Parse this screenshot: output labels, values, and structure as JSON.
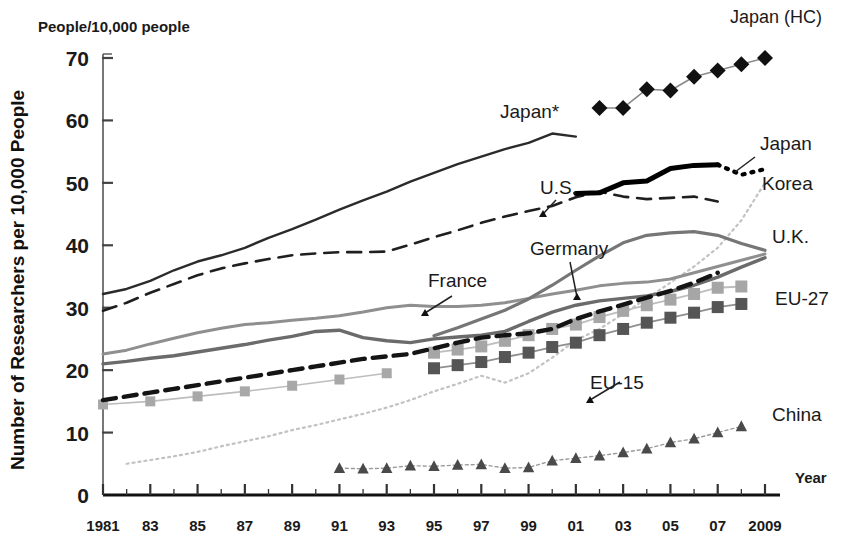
{
  "chart_data": {
    "type": "line",
    "title": "",
    "unit_note": "People/10,000 people",
    "ylabel": "Number of Researchers per 10,000 People",
    "xlabel": "Year",
    "ylim": [
      0,
      70
    ],
    "yticks": [
      "0",
      "10",
      "20",
      "30",
      "40",
      "50",
      "60",
      "70"
    ],
    "xlim": [
      1981,
      2009
    ],
    "xticks": [
      "1981",
      "83",
      "85",
      "87",
      "89",
      "91",
      "93",
      "95",
      "97",
      "99",
      "01",
      "03",
      "05",
      "07",
      "2009"
    ],
    "grid": false,
    "legend_position": "inline-annotations",
    "series": [
      {
        "name": "Japan*",
        "label": "Japan*",
        "style": "solid-thin-dark",
        "color": "#2b2b2b",
        "x": [
          1981,
          1982,
          1983,
          1984,
          1985,
          1986,
          1987,
          1988,
          1989,
          1990,
          1991,
          1992,
          1993,
          1994,
          1995,
          1996,
          1997,
          1998,
          1999,
          2000,
          2001
        ],
        "values": [
          32.2,
          33.0,
          34.3,
          36.0,
          37.4,
          38.4,
          39.6,
          41.2,
          42.6,
          44.1,
          45.7,
          47.2,
          48.6,
          50.2,
          51.6,
          53.0,
          54.2,
          55.4,
          56.4,
          57.9,
          57.4
        ]
      },
      {
        "name": "U.S.",
        "label": "U.S.",
        "style": "dashed-dark",
        "color": "#1f1f1f",
        "x": [
          1981,
          1982,
          1983,
          1984,
          1985,
          1986,
          1987,
          1988,
          1989,
          1990,
          1991,
          1992,
          1993,
          1994,
          1995,
          1996,
          1997,
          1998,
          1999,
          2000,
          2001,
          2002,
          2003,
          2004,
          2005,
          2006,
          2007
        ],
        "values": [
          29.5,
          30.8,
          32.4,
          33.8,
          35.2,
          36.3,
          37.1,
          37.8,
          38.4,
          38.7,
          38.9,
          38.9,
          39.0,
          40.1,
          41.3,
          42.4,
          43.6,
          44.6,
          45.5,
          46.3,
          47.7,
          48.6,
          47.8,
          47.4,
          47.6,
          47.8,
          47.0
        ]
      },
      {
        "name": "Japan",
        "label": "Japan",
        "style": "solid-thick-black",
        "color": "#000000",
        "x": [
          2001,
          2002,
          2003,
          2004,
          2005,
          2006,
          2007
        ],
        "values": [
          48.3,
          48.4,
          50.0,
          50.3,
          52.3,
          52.8,
          52.9
        ]
      },
      {
        "name": "Japan (tail)",
        "label": "",
        "style": "dotted-black",
        "color": "#000000",
        "x": [
          2007,
          2008,
          2009
        ],
        "values": [
          52.9,
          51.3,
          52.2
        ]
      },
      {
        "name": "Japan (HC)",
        "label": "Japan (HC)",
        "style": "marker-diamond",
        "color": "#111111",
        "x": [
          2002,
          2003,
          2004,
          2005,
          2006,
          2007,
          2008,
          2009
        ],
        "values": [
          62.0,
          62.0,
          65.0,
          64.8,
          67.0,
          68.0,
          69.0,
          70.0
        ]
      },
      {
        "name": "Korea",
        "label": "Korea",
        "style": "dotted-lightgray",
        "color": "#b9b9b9",
        "x": [
          1982,
          1983,
          1984,
          1985,
          1986,
          1987,
          1988,
          1989,
          1990,
          1991,
          1992,
          1993,
          1994,
          1995,
          1996,
          1997,
          1998,
          1999,
          2000,
          2001,
          2002,
          2003,
          2004,
          2005,
          2006,
          2007,
          2008,
          2009
        ],
        "values": [
          5.0,
          5.6,
          6.2,
          6.9,
          7.8,
          8.6,
          9.4,
          10.4,
          11.2,
          12.1,
          13.0,
          14.0,
          15.2,
          16.6,
          17.8,
          19.1,
          18.0,
          19.5,
          22.0,
          24.8,
          26.6,
          29.0,
          31.5,
          34.0,
          36.6,
          39.6,
          44.0,
          50.0
        ]
      },
      {
        "name": "Germany",
        "label": "Germany",
        "style": "solid-gray",
        "color": "#6d6d6d",
        "x": [
          1981,
          1982,
          1983,
          1984,
          1985,
          1986,
          1987,
          1988,
          1989,
          1990,
          1991,
          1992,
          1993,
          1994,
          1995,
          1996,
          1997,
          1998,
          1999,
          2000,
          2001,
          2002,
          2003,
          2004,
          2005,
          2006,
          2007,
          2008,
          2009
        ],
        "values": [
          21.0,
          21.4,
          21.9,
          22.3,
          22.9,
          23.5,
          24.1,
          24.8,
          25.4,
          26.2,
          26.4,
          25.2,
          24.7,
          24.4,
          25.0,
          25.3,
          25.6,
          26.2,
          27.8,
          29.3,
          30.4,
          31.1,
          31.5,
          31.9,
          32.6,
          33.6,
          34.9,
          36.5,
          38.0
        ]
      },
      {
        "name": "France",
        "label": "France",
        "style": "solid-gray-light",
        "color": "#8a8a8a",
        "x": [
          1981,
          1982,
          1983,
          1984,
          1985,
          1986,
          1987,
          1988,
          1989,
          1990,
          1991,
          1992,
          1993,
          1994,
          1995,
          1996,
          1997,
          1998,
          1999,
          2000,
          2001,
          2002,
          2003,
          2004,
          2005,
          2006,
          2007,
          2008,
          2009
        ],
        "values": [
          22.6,
          23.2,
          24.2,
          25.1,
          26.0,
          26.7,
          27.3,
          27.6,
          28.0,
          28.3,
          28.7,
          29.3,
          30.0,
          30.4,
          30.2,
          30.2,
          30.4,
          30.8,
          31.5,
          32.2,
          32.8,
          33.5,
          33.9,
          34.1,
          34.6,
          35.6,
          36.6,
          37.6,
          38.6
        ]
      },
      {
        "name": "U.K.",
        "label": "U.K.",
        "style": "solid-gray-mid",
        "color": "#707070",
        "x": [
          1995,
          1996,
          1997,
          1998,
          1999,
          2000,
          2001,
          2002,
          2003,
          2004,
          2005,
          2006,
          2007,
          2008,
          2009
        ],
        "values": [
          25.5,
          26.8,
          28.2,
          29.6,
          31.4,
          33.6,
          36.0,
          38.3,
          40.4,
          41.6,
          42.0,
          42.2,
          41.6,
          40.3,
          39.2
        ]
      },
      {
        "name": "EU-15",
        "label": "EU-15",
        "style": "marker-square-light",
        "color": "#a0a0a0",
        "x": [
          1995,
          1996,
          1997,
          1998,
          1999,
          2000,
          2001,
          2002,
          2003,
          2004,
          2005,
          2006,
          2007,
          2008
        ],
        "values": [
          22.8,
          23.3,
          23.8,
          24.7,
          25.6,
          26.6,
          27.3,
          28.5,
          29.5,
          30.4,
          31.3,
          32.2,
          33.2,
          33.4
        ]
      },
      {
        "name": "EU-27",
        "label": "EU-27",
        "style": "marker-square-dark",
        "color": "#5a5a5a",
        "x": [
          1995,
          1996,
          1997,
          1998,
          1999,
          2000,
          2001,
          2002,
          2003,
          2004,
          2005,
          2006,
          2007,
          2008
        ],
        "values": [
          20.3,
          20.8,
          21.3,
          22.1,
          22.8,
          23.7,
          24.4,
          25.6,
          26.6,
          27.6,
          28.4,
          29.2,
          30.1,
          30.6
        ]
      },
      {
        "name": "EU-15 dashed",
        "label": "",
        "style": "dashed-thick-black",
        "color": "#101010",
        "x": [
          1981,
          1982,
          1983,
          1984,
          1985,
          1986,
          1987,
          1988,
          1989,
          1990,
          1991,
          1992,
          1993,
          1994,
          1995,
          1996,
          1997,
          1998,
          1999,
          2000,
          2001,
          2002,
          2003,
          2004,
          2005,
          2006,
          2007
        ],
        "values": [
          15.2,
          15.8,
          16.4,
          17.0,
          17.6,
          18.2,
          18.8,
          19.4,
          20.0,
          20.6,
          21.2,
          21.8,
          22.2,
          22.6,
          23.5,
          24.4,
          25.2,
          25.6,
          25.9,
          26.6,
          28.2,
          29.4,
          30.5,
          31.6,
          32.7,
          34.0,
          35.6
        ]
      },
      {
        "name": "EU-27 squares early",
        "label": "",
        "style": "marker-square-light",
        "color": "#a0a0a0",
        "x": [
          1981,
          1983,
          1985,
          1987,
          1989,
          1991,
          1993
        ],
        "values": [
          14.5,
          15.0,
          15.8,
          16.6,
          17.5,
          18.5,
          19.5
        ]
      },
      {
        "name": "China",
        "label": "China",
        "style": "marker-triangle",
        "color": "#4a4a4a",
        "x": [
          1991,
          1992,
          1993,
          1994,
          1995,
          1996,
          1997,
          1998,
          1999,
          2000,
          2001,
          2002,
          2003,
          2004,
          2005,
          2006,
          2007,
          2008
        ],
        "values": [
          4.3,
          4.2,
          4.3,
          4.7,
          4.6,
          4.8,
          4.9,
          4.3,
          4.4,
          5.5,
          5.9,
          6.3,
          6.8,
          7.4,
          8.4,
          9.0,
          10.0,
          11.0
        ]
      }
    ],
    "annotations": [
      {
        "text": "Japan*",
        "x_px": 500,
        "y_px": 118,
        "name": "annotation-japan-star"
      },
      {
        "text": "U.S.",
        "x_px": 540,
        "y_px": 194,
        "name": "annotation-us"
      },
      {
        "text": "Germany",
        "x_px": 530,
        "y_px": 255,
        "name": "annotation-germany"
      },
      {
        "text": "France",
        "x_px": 428,
        "y_px": 287,
        "name": "annotation-france"
      },
      {
        "text": "EU-15",
        "x_px": 590,
        "y_px": 389,
        "name": "annotation-eu15"
      },
      {
        "text": "Japan (HC)",
        "x_px": 730,
        "y_px": 23,
        "name": "annotation-japan-hc"
      },
      {
        "text": "Japan",
        "x_px": 760,
        "y_px": 150,
        "name": "annotation-japan"
      },
      {
        "text": "Korea",
        "x_px": 762,
        "y_px": 190,
        "name": "annotation-korea"
      },
      {
        "text": "U.K.",
        "x_px": 772,
        "y_px": 243,
        "name": "annotation-uk"
      },
      {
        "text": "EU-27",
        "x_px": 775,
        "y_px": 305,
        "name": "annotation-eu27"
      },
      {
        "text": "China",
        "x_px": 772,
        "y_px": 421,
        "name": "annotation-china"
      }
    ]
  },
  "axes": {
    "unit_note": "People/10,000 people",
    "ylabel": "Number of Researchers per 10,000 People",
    "xlabel": "Year"
  }
}
